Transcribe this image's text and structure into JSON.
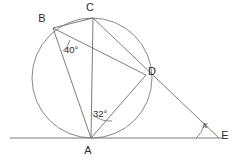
{
  "figure": {
    "background_color": "#ffffff",
    "line_color": "#6e6e6e",
    "circle_color": "#7a7a7a",
    "text_color": "#2b2b2b"
  },
  "circle": {
    "name": "main-circle",
    "center_x": 92,
    "center_y": 78,
    "radius": 60
  },
  "points": [
    {
      "id": "A",
      "label": "A",
      "x": 91,
      "y": 138,
      "label_x": 88,
      "label_y": 151
    },
    {
      "id": "B",
      "label": "B",
      "x": 53,
      "y": 28,
      "label_x": 42,
      "label_y": 19
    },
    {
      "id": "C",
      "label": "C",
      "x": 93,
      "y": 18,
      "label_x": 90,
      "label_y": 8
    },
    {
      "id": "D",
      "label": "D",
      "x": 146,
      "y": 75,
      "label_x": 152,
      "label_y": 72
    },
    {
      "id": "E",
      "label": "E",
      "x": 219,
      "y": 138,
      "label_x": 225,
      "label_y": 136
    }
  ],
  "segments": [
    {
      "name": "segment-tangent-line",
      "from": "tangent-left",
      "to": "tangent-right",
      "x1": 10,
      "y1": 138,
      "x2": 222,
      "y2": 138
    },
    {
      "name": "segment-BC",
      "from": "B",
      "to": "C",
      "x1": 53,
      "y1": 28,
      "x2": 93,
      "y2": 18
    },
    {
      "name": "segment-BD",
      "from": "B",
      "to": "D",
      "x1": 53,
      "y1": 28,
      "x2": 146,
      "y2": 75
    },
    {
      "name": "segment-BA",
      "from": "B",
      "to": "A",
      "x1": 53,
      "y1": 28,
      "x2": 91,
      "y2": 138
    },
    {
      "name": "segment-CA",
      "from": "C",
      "to": "A",
      "x1": 93,
      "y1": 18,
      "x2": 91,
      "y2": 138
    },
    {
      "name": "segment-CE",
      "from": "C",
      "to": "E",
      "x1": 93,
      "y1": 18,
      "x2": 219,
      "y2": 138
    },
    {
      "name": "segment-AD",
      "from": "A",
      "to": "D",
      "x1": 91,
      "y1": 138,
      "x2": 146,
      "y2": 75
    },
    {
      "name": "segment-AE",
      "from": "A",
      "to": "E",
      "x1": 91,
      "y1": 138,
      "x2": 219,
      "y2": 138
    }
  ],
  "angles": [
    {
      "name": "angle-at-B",
      "label": "40°",
      "vertex": "B",
      "value": 40,
      "unit": "degrees",
      "label_x": 64,
      "label_y": 50,
      "arc_path": "M 70 40 A 20 20 0 0 1 63 51"
    },
    {
      "name": "angle-at-A",
      "label": "32°",
      "vertex": "A",
      "value": 32,
      "unit": "degrees",
      "label_x": 93,
      "label_y": 114,
      "arc_path": "M 91.5 113 A 25 25 0 0 0 112 121"
    },
    {
      "name": "angle-at-E",
      "label": "x",
      "vertex": "E",
      "value": null,
      "unit": "unknown",
      "label_x": 203,
      "label_y": 125,
      "arc_path": "M 196 138 A 23 23 0 0 0 204 124"
    }
  ]
}
